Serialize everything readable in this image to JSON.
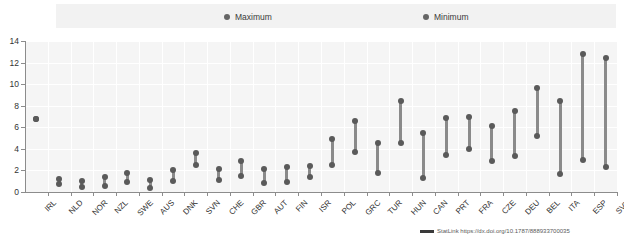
{
  "legend": {
    "items": [
      {
        "label": "Maximum",
        "color": "#666666"
      },
      {
        "label": "Minimum",
        "color": "#666666"
      }
    ]
  },
  "footer": {
    "text": "StatLink  https://dx.doi.org/10.1787/888933700035"
  },
  "chart_data": {
    "type": "bar",
    "subtype": "dumbbell-range",
    "title": "",
    "xlabel": "",
    "ylabel": "",
    "ylim": [
      0,
      14
    ],
    "yticks": [
      0,
      2,
      4,
      6,
      8,
      10,
      12,
      14
    ],
    "grid": true,
    "legend_position": "top",
    "categories": [
      "IRL",
      "NLD",
      "NOR",
      "NZL",
      "SWE",
      "AUS",
      "DNK",
      "SVN",
      "CHE",
      "GBR",
      "AUT",
      "FIN",
      "ISR",
      "POL",
      "GRC",
      "TUR",
      "HUN",
      "CAN",
      "PRT",
      "FRA",
      "CZE",
      "DEU",
      "BEL",
      "ITA",
      "ESP",
      "SVK"
    ],
    "series": [
      {
        "name": "Maximum",
        "values": [
          6.8,
          1.2,
          1.0,
          1.4,
          1.8,
          1.1,
          2.0,
          3.6,
          2.1,
          2.9,
          2.1,
          2.3,
          2.4,
          4.9,
          6.6,
          4.5,
          8.4,
          5.5,
          6.9,
          7.0,
          6.1,
          7.5,
          9.6,
          8.4,
          12.8,
          12.4
        ]
      },
      {
        "name": "Minimum",
        "values": [
          6.8,
          0.7,
          0.5,
          0.6,
          0.9,
          0.4,
          1.0,
          2.5,
          1.1,
          1.5,
          0.8,
          0.9,
          1.4,
          2.5,
          3.7,
          1.8,
          4.5,
          1.3,
          3.4,
          4.0,
          2.9,
          3.3,
          5.2,
          1.7,
          3.0,
          2.3
        ]
      }
    ]
  }
}
